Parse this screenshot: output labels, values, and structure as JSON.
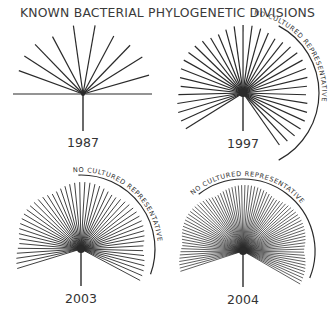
{
  "title": "KNOWN BACTERIAL PHYLOGENETIC DIVISIONS",
  "colors": {
    "line": "#2a2a2a",
    "text": "#333333",
    "background": "#ffffff"
  },
  "panels": [
    {
      "year": "1987",
      "center": [
        83,
        94
      ],
      "stem_end": 131,
      "label_y": 147,
      "ray_radius": 70,
      "horizontal_span": [
        13,
        152
      ],
      "angles": [
        160,
        147,
        134,
        118,
        98,
        80,
        62,
        46,
        32,
        16
      ],
      "bracket": null
    },
    {
      "year": "1997",
      "center": [
        243,
        93
      ],
      "stem_end": 131,
      "label_y": 148,
      "ray_radius": 68,
      "ray_count": 36,
      "angle_start": 212,
      "angle_end": -55,
      "bracket": {
        "label": "NO CULTURED REPRESENTATIVE",
        "radius": 76,
        "from": 62,
        "to": -62
      }
    },
    {
      "year": "2003",
      "center": [
        81,
        249
      ],
      "stem_end": 286,
      "label_y": 303,
      "ray_radius": 67,
      "ray_count": 52,
      "angle_start": 197,
      "angle_end": -28,
      "bracket": {
        "label": "NO CULTURED REPRESENTATIVE",
        "radius": 74,
        "from": 92,
        "to": -20
      }
    },
    {
      "year": "2004",
      "center": [
        243,
        251
      ],
      "stem_end": 287,
      "label_y": 304,
      "ray_radius": 66,
      "ray_count": 80,
      "angle_start": 198,
      "angle_end": -30,
      "bracket": {
        "label": "NO CULTURED REPRESENTATIVE",
        "radius": 72,
        "from": 128,
        "to": -22
      }
    }
  ]
}
